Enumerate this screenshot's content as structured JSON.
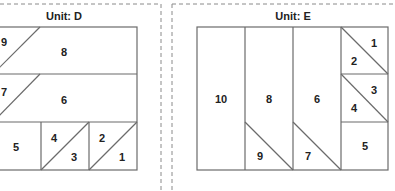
{
  "colors": {
    "line": "#6b6b6b",
    "dash": "#8a8a8a",
    "text": "#222222",
    "background": "#ffffff"
  },
  "panels": [
    {
      "title": "Unit: D",
      "pieces": [
        {
          "label": "9",
          "region": "row1-left-triangle"
        },
        {
          "label": "8",
          "region": "row1-main"
        },
        {
          "label": "7",
          "region": "row2-left-triangle"
        },
        {
          "label": "6",
          "region": "row2-main"
        },
        {
          "label": "5",
          "region": "row3-square"
        },
        {
          "label": "4",
          "region": "row3-mid-upper-triangle"
        },
        {
          "label": "3",
          "region": "row3-mid-lower-triangle"
        },
        {
          "label": "2",
          "region": "row3-right-upper-triangle"
        },
        {
          "label": "1",
          "region": "row3-right-lower-triangle"
        }
      ]
    },
    {
      "title": "Unit: E",
      "pieces": [
        {
          "label": "10",
          "region": "col1"
        },
        {
          "label": "8",
          "region": "col2-main"
        },
        {
          "label": "9",
          "region": "col2-bottom-triangle"
        },
        {
          "label": "6",
          "region": "col3-main"
        },
        {
          "label": "7",
          "region": "col3-bottom-triangle"
        },
        {
          "label": "1",
          "region": "col4-top-upper-triangle"
        },
        {
          "label": "2",
          "region": "col4-top-lower-triangle"
        },
        {
          "label": "3",
          "region": "col4-mid-upper-triangle"
        },
        {
          "label": "4",
          "region": "col4-mid-lower-triangle"
        },
        {
          "label": "5",
          "region": "col4-bottom-square"
        }
      ]
    }
  ]
}
